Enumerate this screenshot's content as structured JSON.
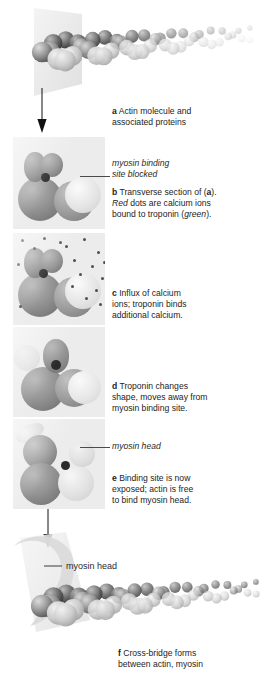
{
  "figure": {
    "background": "#ffffff",
    "panel_background": "#ececec"
  },
  "captions": [
    {
      "label": "a",
      "lines": [
        "Actin molecule and",
        "associated proteins"
      ]
    },
    {
      "label": "b",
      "lines": [
        "Transverse section of (a).",
        "Red dots are calcium ions",
        "bound to troponin (green)."
      ],
      "italics": [
        "Red",
        "green"
      ]
    },
    {
      "label": "c",
      "lines": [
        "Influx of calcium",
        "ions; troponin binds",
        "additional calcium."
      ]
    },
    {
      "label": "d",
      "lines": [
        "Troponin changes",
        "shape, moves away from",
        "myosin binding site."
      ]
    },
    {
      "label": "e",
      "lines": [
        "Binding site is now",
        "exposed; actin is free",
        "to bind myosin head."
      ]
    },
    {
      "label": "f",
      "lines": [
        "Cross-bridge forms",
        "between actin, myosin"
      ]
    }
  ],
  "annotations": {
    "binding_site": {
      "line1": "myosin binding",
      "line2": "site blocked",
      "style": "italic"
    },
    "myosin_head_panel_e": {
      "text": "myosin head",
      "style": "italic"
    },
    "myosin_head_bottom": {
      "text": "myosin head",
      "style": "upright"
    }
  },
  "colors": {
    "actin_dark": "#4a4a4a",
    "actin_mid": "#7d7d7d",
    "actin_light": "#d8d8d8",
    "binding_site_dot": "#2b2b2b",
    "calcium_dot": "#4f4f4f",
    "leader_line": "#4a4a4a",
    "arrow": "#111111",
    "cut_plane": "#e6e6e6"
  },
  "panels": {
    "b": {
      "calcium_dots": 0,
      "binding_site": "blocked"
    },
    "c": {
      "calcium_dots": 18,
      "binding_site": "blocked"
    },
    "d": {
      "calcium_dots": 0,
      "binding_site": "shifting"
    },
    "e": {
      "calcium_dots": 0,
      "binding_site": "exposed"
    }
  },
  "arrows": [
    {
      "name": "arrow-a-to-b",
      "from": "actin filament",
      "to": "panel b"
    },
    {
      "name": "arrow-e-to-f",
      "from": "panel e",
      "to": "cross-bridge view"
    }
  ]
}
